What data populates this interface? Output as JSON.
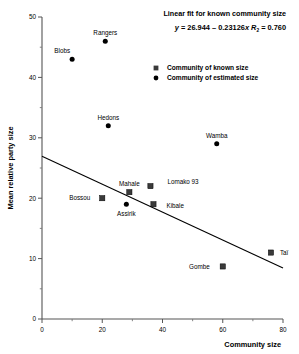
{
  "chart_data": {
    "type": "scatter",
    "title": "Linear fit for known community size",
    "equation": "y = 26.944 – 0.23126x",
    "equation_y": "y",
    "equation_body": " = 26.944 – 0.23126",
    "equation_x": "x",
    "r2_symbol": "R",
    "r2_sub": "2",
    "r2_value": " = 0.760",
    "xlabel": "Community  size",
    "ylabel": "Mean relative party size",
    "xlim": [
      0,
      80
    ],
    "ylim": [
      0,
      50
    ],
    "xticks": [
      0,
      20,
      40,
      60,
      80
    ],
    "xticks_minor": [
      10,
      30,
      50,
      70
    ],
    "yticks": [
      0,
      10,
      20,
      30,
      40,
      50
    ],
    "yticks_minor": [
      5,
      15,
      25,
      35,
      45
    ],
    "grid": false,
    "legend_position": "top-right",
    "fit": {
      "intercept": 26.944,
      "slope": -0.23126,
      "r2": 0.76
    },
    "legend": [
      {
        "marker": "square",
        "label": "Community of known size"
      },
      {
        "marker": "circle",
        "label": "Community of estimated size"
      }
    ],
    "series": [
      {
        "name": "Community of known size",
        "marker": "square",
        "points": [
          {
            "label": "Bossou",
            "x": 20,
            "y": 20.0,
            "lx": -12,
            "ly": 0
          },
          {
            "label": "Mahale",
            "x": 29,
            "y": 21.0,
            "lx": 0,
            "ly": -8
          },
          {
            "label": "Lomako 93",
            "x": 36,
            "y": 22.0,
            "lx": 17,
            "ly": -4
          },
          {
            "label": "Kibale",
            "x": 37,
            "y": 19.0,
            "lx": 13,
            "ly": 2
          },
          {
            "label": "Gombe",
            "x": 60,
            "y": 8.7,
            "lx": -13,
            "ly": 0
          },
          {
            "label": "Taï",
            "x": 76,
            "y": 11.0,
            "lx": 9,
            "ly": 0
          }
        ]
      },
      {
        "name": "Community of estimated size",
        "marker": "circle",
        "points": [
          {
            "label": "Blobs",
            "x": 10,
            "y": 43.0,
            "lx": -2,
            "ly": -8
          },
          {
            "label": "Rangers",
            "x": 21,
            "y": 46.0,
            "lx": 0,
            "ly": -8
          },
          {
            "label": "Hedons",
            "x": 22,
            "y": 32.0,
            "lx": 0,
            "ly": -8
          },
          {
            "label": "Wamba",
            "x": 58,
            "y": 29.0,
            "lx": 0,
            "ly": -8
          },
          {
            "label": "Assirik",
            "x": 28,
            "y": 19.0,
            "lx": 0,
            "ly": 10
          }
        ]
      }
    ]
  }
}
